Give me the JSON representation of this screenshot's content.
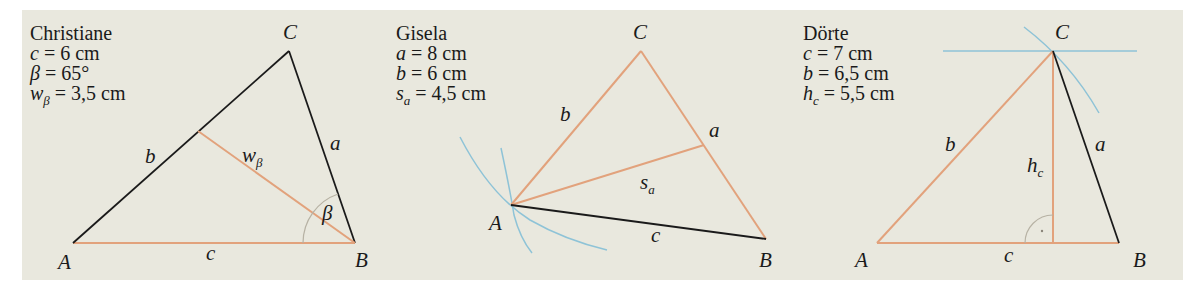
{
  "colors": {
    "background": "#e9e8de",
    "side_black": "#1a1a1a",
    "side_orange": "#e2a27c",
    "construction_blue": "#8ec3d7",
    "angle_arc": "#b7b2a4"
  },
  "figures": [
    {
      "name": "Christiane",
      "given": [
        {
          "var": "c",
          "sub": "",
          "value": " = 6 cm"
        },
        {
          "var": "β",
          "sub": "",
          "value": " = 65°"
        },
        {
          "var": "w",
          "sub": "β",
          "value": " = 3,5 cm"
        }
      ],
      "vertices": {
        "A": "A",
        "B": "B",
        "C": "C"
      },
      "sides": {
        "a": "a",
        "b": "b",
        "c": "c"
      },
      "special": {
        "segment": "w",
        "segment_sub": "β",
        "angle": "β"
      }
    },
    {
      "name": "Gisela",
      "given": [
        {
          "var": "a",
          "sub": "",
          "value": " = 8 cm"
        },
        {
          "var": "b",
          "sub": "",
          "value": " = 6 cm"
        },
        {
          "var": "s",
          "sub": "a",
          "value": " = 4,5 cm"
        }
      ],
      "vertices": {
        "A": "A",
        "B": "B",
        "C": "C"
      },
      "sides": {
        "a": "a",
        "b": "b",
        "c": "c"
      },
      "special": {
        "segment": "s",
        "segment_sub": "a"
      }
    },
    {
      "name": "Dörte",
      "given": [
        {
          "var": "c",
          "sub": "",
          "value": " = 7 cm"
        },
        {
          "var": "b",
          "sub": "",
          "value": " = 6,5 cm"
        },
        {
          "var": "h",
          "sub": "c",
          "value": " = 5,5 cm"
        }
      ],
      "vertices": {
        "A": "A",
        "B": "B",
        "C": "C"
      },
      "sides": {
        "a": "a",
        "b": "b",
        "c": "c"
      },
      "special": {
        "segment": "h",
        "segment_sub": "c"
      }
    }
  ]
}
